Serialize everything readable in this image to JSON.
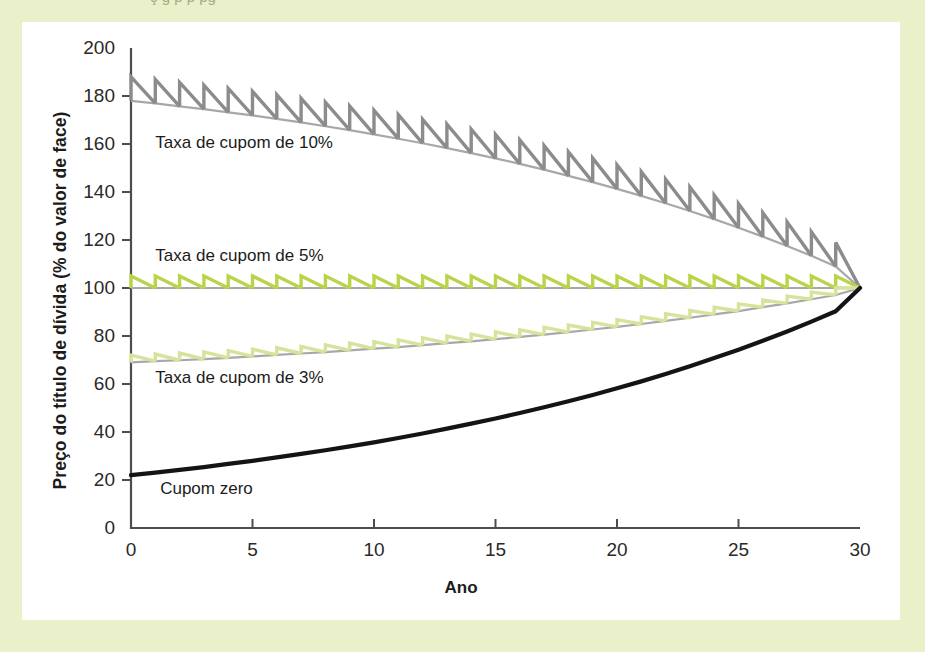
{
  "page": {
    "background_color": "#e9f0ca",
    "card_color": "#ffffff",
    "clipped_top_text": "ç                                      g            p                p        pg"
  },
  "chart_data": {
    "type": "line",
    "title": "",
    "xlabel": "Ano",
    "ylabel": "Preço do título de dívida (% do valor de face)",
    "xlim": [
      0,
      30
    ],
    "ylim": [
      0,
      200
    ],
    "xticks": [
      0,
      5,
      10,
      15,
      20,
      25,
      30
    ],
    "yticks": [
      0,
      20,
      40,
      60,
      80,
      100,
      120,
      140,
      160,
      180,
      200
    ],
    "grid": false,
    "legend_position": "inline-annotations",
    "x": [
      0,
      1,
      2,
      3,
      4,
      5,
      6,
      7,
      8,
      9,
      10,
      11,
      12,
      13,
      14,
      15,
      16,
      17,
      18,
      19,
      20,
      21,
      22,
      23,
      24,
      25,
      26,
      27,
      28,
      29,
      30
    ],
    "series": [
      {
        "name": "Taxa de cupom de 10%",
        "annotation": "Taxa de cupom de 10%",
        "color": "#8c8c8c",
        "style": "sawtooth",
        "coupon_rate": 10,
        "values": [
          178.0,
          176.9,
          175.7,
          174.5,
          173.2,
          171.9,
          170.5,
          169.0,
          167.4,
          165.8,
          164.0,
          162.2,
          160.3,
          158.3,
          156.2,
          154.0,
          151.7,
          149.3,
          146.7,
          144.1,
          141.3,
          138.4,
          135.3,
          132.1,
          128.7,
          125.1,
          121.4,
          117.5,
          113.4,
          109.0,
          100.0
        ]
      },
      {
        "name": "Taxa de cupom de 5%",
        "annotation": "Taxa de cupom de 5%",
        "color": "#b9d44b",
        "style": "sawtooth",
        "coupon_rate": 5,
        "values": [
          100.0,
          100.0,
          100.0,
          100.0,
          100.0,
          100.0,
          100.0,
          100.0,
          100.0,
          100.0,
          100.0,
          100.0,
          100.0,
          100.0,
          100.0,
          100.0,
          100.0,
          100.0,
          100.0,
          100.0,
          100.0,
          100.0,
          100.0,
          100.0,
          100.0,
          100.0,
          100.0,
          100.0,
          100.0,
          100.0,
          100.0
        ]
      },
      {
        "name": "Taxa de cupom de 3%",
        "annotation": "Taxa de cupom de 3%",
        "color": "#d4e49a",
        "style": "sawtooth",
        "coupon_rate": 3,
        "values": [
          69.0,
          69.5,
          69.9,
          70.4,
          70.9,
          71.5,
          72.1,
          72.7,
          73.3,
          74.0,
          74.7,
          75.4,
          76.2,
          77.0,
          77.8,
          78.7,
          79.6,
          80.6,
          81.6,
          82.7,
          83.8,
          85.0,
          86.3,
          87.6,
          89.0,
          90.4,
          92.0,
          93.6,
          95.3,
          97.1,
          100.0
        ]
      },
      {
        "name": "Cupom zero",
        "annotation": "Cupom zero",
        "color": "#141414",
        "style": "smooth",
        "coupon_rate": 0,
        "values": [
          22.0,
          23.1,
          24.2,
          25.4,
          26.7,
          28.0,
          29.4,
          30.9,
          32.4,
          34.0,
          35.7,
          37.5,
          39.4,
          41.4,
          43.5,
          45.6,
          47.9,
          50.3,
          52.8,
          55.4,
          58.2,
          61.1,
          64.2,
          67.4,
          70.8,
          74.3,
          78.0,
          81.9,
          86.0,
          90.3,
          100.0
        ]
      }
    ],
    "annotations": [
      {
        "text": "Taxa de cupom de 10%",
        "x": 1.0,
        "y": 160
      },
      {
        "text": "Taxa de cupom de 5%",
        "x": 1.0,
        "y": 113
      },
      {
        "text": "Taxa de cupom de 3%",
        "x": 1.0,
        "y": 62
      },
      {
        "text": "Cupom zero",
        "x": 1.2,
        "y": 16
      }
    ]
  }
}
